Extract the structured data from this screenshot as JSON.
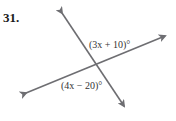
{
  "problem": {
    "number": "31.",
    "angle_labels": [
      "(3x + 10)°",
      "(4x − 20)°"
    ]
  },
  "figure": {
    "line_color": "#6e6e72",
    "lines": [
      {
        "name": "steep-line",
        "from": [
          62,
          13
        ],
        "to": [
          124,
          106
        ]
      },
      {
        "name": "shallow-line",
        "from": [
          26,
          93
        ],
        "to": [
          165,
          36
        ]
      }
    ]
  }
}
